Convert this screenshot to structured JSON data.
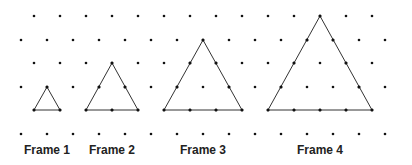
{
  "diagram": {
    "title": "",
    "grid": {
      "type": "isometric-dot-grid",
      "rows_y": [
        16,
        40,
        63,
        87,
        110,
        134
      ],
      "odd_row_x_start": 34,
      "even_row_x_start": 21,
      "spacing_x": 26,
      "max_x": 390,
      "dot_color": "#111111"
    },
    "frames": [
      {
        "label": "Frame 1",
        "label_x": 47,
        "side_units": 1,
        "triangle": [
          [
            47,
            87
          ],
          [
            34,
            110
          ],
          [
            60,
            110
          ]
        ],
        "marked_points": [
          [
            47,
            87
          ],
          [
            34,
            110
          ],
          [
            60,
            110
          ]
        ]
      },
      {
        "label": "Frame 2",
        "label_x": 112,
        "side_units": 2,
        "triangle": [
          [
            112,
            63
          ],
          [
            86,
            110
          ],
          [
            138,
            110
          ]
        ],
        "marked_points": [
          [
            112,
            63
          ],
          [
            99,
            87
          ],
          [
            125,
            87
          ],
          [
            86,
            110
          ],
          [
            112,
            110
          ],
          [
            138,
            110
          ]
        ]
      },
      {
        "label": "Frame 3",
        "label_x": 203,
        "side_units": 3,
        "triangle": [
          [
            203,
            40
          ],
          [
            164,
            110
          ],
          [
            242,
            110
          ]
        ],
        "marked_points": [
          [
            203,
            40
          ],
          [
            190,
            63
          ],
          [
            216,
            63
          ],
          [
            177,
            87
          ],
          [
            229,
            87
          ],
          [
            164,
            110
          ],
          [
            190,
            110
          ],
          [
            216,
            110
          ],
          [
            242,
            110
          ]
        ]
      },
      {
        "label": "Frame 4",
        "label_x": 320,
        "side_units": 4,
        "triangle": [
          [
            320,
            16
          ],
          [
            268,
            110
          ],
          [
            372,
            110
          ]
        ],
        "marked_points": [
          [
            320,
            16
          ],
          [
            307,
            40
          ],
          [
            333,
            40
          ],
          [
            294,
            63
          ],
          [
            346,
            63
          ],
          [
            281,
            87
          ],
          [
            359,
            87
          ],
          [
            268,
            110
          ],
          [
            294,
            110
          ],
          [
            320,
            110
          ],
          [
            346,
            110
          ],
          [
            372,
            110
          ]
        ]
      }
    ],
    "line_color": "#333333"
  }
}
